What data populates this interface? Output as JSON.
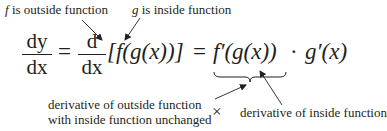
{
  "annotations": {
    "top_left": {
      "var": "f",
      "text": " is outside function"
    },
    "top_right": {
      "var": "g",
      "text": " is inside function"
    },
    "bottom_left_line1": "derivative of outside function",
    "bottom_left_line2": "with inside function unchanged",
    "bottom_right": "derivative of inside function",
    "times_symbol": "×"
  },
  "equation": {
    "lhs_num": "dy",
    "lhs_den": "dx",
    "equals1": "=",
    "op_num": "d",
    "op_den": "dx",
    "bracket_expr": "[f(g(x))]",
    "equals2": "=",
    "outer_derivative": "f′(g(x))",
    "dot": "·",
    "inner_derivative": "g′(x)"
  },
  "colors": {
    "text": "#231f20",
    "background": "#ffffff"
  }
}
